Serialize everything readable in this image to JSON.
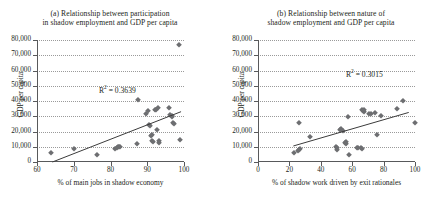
{
  "figure": {
    "panels": [
      {
        "id": "panel-a",
        "title_line1": "(a) Relationship between participation",
        "title_line2": "in shadow employment and GDP per capita",
        "r2_prefix": "R",
        "r2_sup": "2",
        "r2_value": " = 0.3639"
      },
      {
        "id": "panel-b",
        "title_line1": "(b) Relationship between nature of",
        "title_line2": "shadow employment and GDP per capita",
        "r2_prefix": "R",
        "r2_sup": "2",
        "r2_value": " = 0.3015"
      }
    ]
  },
  "chart_data": [
    {
      "type": "scatter",
      "panel": "a",
      "title": "(a) Relationship between participation in shadow employment and GDP per capita",
      "xlabel": "% of main jobs in shadow economy",
      "ylabel": "GDP per capita",
      "xlim": [
        60,
        100
      ],
      "ylim": [
        0,
        80000
      ],
      "xticks": [
        60,
        70,
        80,
        90,
        100
      ],
      "xticklabels": [
        "60",
        "70",
        "80",
        "90",
        "100"
      ],
      "yticks": [
        0,
        10000,
        20000,
        30000,
        40000,
        50000,
        60000,
        70000,
        80000
      ],
      "yticklabels": [
        "0",
        "10,000",
        "20,000",
        "30,000",
        "40,000",
        "50,000",
        "60,000",
        "70,000",
        "80,000"
      ],
      "grid": "horizontal-dotted",
      "legend": "none",
      "marker": "diamond",
      "marker_color": "#6d6e71",
      "annotations": [
        {
          "text": "R2 = 0.3639",
          "x": 87,
          "y": 44500
        }
      ],
      "trendline": {
        "x0": 64.2,
        "y0": 0,
        "x1": 99.2,
        "y1": 33000,
        "r2": 0.3639
      },
      "points": [
        {
          "x": 63.9,
          "y": 5800
        },
        {
          "x": 70.2,
          "y": 8700
        },
        {
          "x": 76.2,
          "y": 4900
        },
        {
          "x": 81.2,
          "y": 8700
        },
        {
          "x": 81.8,
          "y": 9000
        },
        {
          "x": 82.1,
          "y": 9600
        },
        {
          "x": 82.4,
          "y": 9700
        },
        {
          "x": 82.6,
          "y": 9900
        },
        {
          "x": 87.2,
          "y": 11800
        },
        {
          "x": 87.6,
          "y": 40500
        },
        {
          "x": 89.6,
          "y": 31500
        },
        {
          "x": 90.3,
          "y": 33600
        },
        {
          "x": 90.5,
          "y": 24200
        },
        {
          "x": 90.8,
          "y": 23500
        },
        {
          "x": 91.0,
          "y": 16900
        },
        {
          "x": 91.2,
          "y": 17500
        },
        {
          "x": 91.4,
          "y": 13700
        },
        {
          "x": 91.6,
          "y": 12800
        },
        {
          "x": 92.0,
          "y": 33800
        },
        {
          "x": 92.4,
          "y": 34000
        },
        {
          "x": 92.6,
          "y": 21200
        },
        {
          "x": 93.0,
          "y": 35600
        },
        {
          "x": 93.1,
          "y": 13700
        },
        {
          "x": 93.3,
          "y": 12700
        },
        {
          "x": 95.8,
          "y": 35200
        },
        {
          "x": 96.3,
          "y": 30600
        },
        {
          "x": 96.6,
          "y": 30000
        },
        {
          "x": 96.8,
          "y": 29400
        },
        {
          "x": 97.0,
          "y": 25900
        },
        {
          "x": 97.2,
          "y": 25200
        },
        {
          "x": 98.6,
          "y": 76700
        },
        {
          "x": 98.8,
          "y": 14500
        }
      ]
    },
    {
      "type": "scatter",
      "panel": "b",
      "title": "(b) Relationship between nature of shadow employment and GDP per capita",
      "xlabel": "% of shadow work driven by exit rationales",
      "ylabel": "GDP per capita",
      "xlim": [
        0,
        100
      ],
      "ylim": [
        0,
        80000
      ],
      "xticks": [
        0,
        20,
        40,
        60,
        80,
        100
      ],
      "xticklabels": [
        "0",
        "20",
        "40",
        "60",
        "80",
        "100"
      ],
      "yticks": [
        0,
        10000,
        20000,
        30000,
        40000,
        50000,
        60000,
        70000,
        80000
      ],
      "yticklabels": [
        "0",
        "10,000",
        "20,000",
        "30,000",
        "40,000",
        "50,000",
        "60,000",
        "70,000",
        "80,000"
      ],
      "grid": "horizontal-dotted",
      "legend": "none",
      "marker": "diamond",
      "marker_color": "#6d6e71",
      "annotations": [
        {
          "text": "R2 = 0.3015",
          "x": 80,
          "y": 49000
        }
      ],
      "trendline": {
        "x0": 22.5,
        "y0": 10500,
        "x1": 96.0,
        "y1": 32500,
        "r2": 0.3015
      },
      "points": [
        {
          "x": 23.0,
          "y": 5600
        },
        {
          "x": 25.3,
          "y": 6900
        },
        {
          "x": 25.8,
          "y": 25400
        },
        {
          "x": 26.0,
          "y": 8100
        },
        {
          "x": 26.6,
          "y": 8600
        },
        {
          "x": 33.0,
          "y": 16100
        },
        {
          "x": 49.4,
          "y": 9800
        },
        {
          "x": 50.0,
          "y": 9200
        },
        {
          "x": 50.3,
          "y": 8100
        },
        {
          "x": 52.0,
          "y": 21100
        },
        {
          "x": 52.6,
          "y": 21800
        },
        {
          "x": 54.2,
          "y": 20500
        },
        {
          "x": 55.3,
          "y": 12700
        },
        {
          "x": 55.8,
          "y": 11800
        },
        {
          "x": 56.3,
          "y": 13200
        },
        {
          "x": 57.5,
          "y": 29700
        },
        {
          "x": 58.2,
          "y": 4700
        },
        {
          "x": 63.0,
          "y": 9500
        },
        {
          "x": 64.0,
          "y": 9200
        },
        {
          "x": 65.5,
          "y": 9000
        },
        {
          "x": 66.2,
          "y": 8800
        },
        {
          "x": 66.0,
          "y": 33800
        },
        {
          "x": 66.6,
          "y": 33200
        },
        {
          "x": 67.2,
          "y": 32600
        },
        {
          "x": 67.6,
          "y": 34200
        },
        {
          "x": 70.5,
          "y": 31500
        },
        {
          "x": 72.0,
          "y": 31800
        },
        {
          "x": 74.5,
          "y": 32400
        },
        {
          "x": 75.5,
          "y": 17400
        },
        {
          "x": 78.5,
          "y": 30300
        },
        {
          "x": 88.8,
          "y": 34900
        },
        {
          "x": 92.2,
          "y": 40300
        },
        {
          "x": 100.0,
          "y": 25700
        }
      ]
    }
  ]
}
